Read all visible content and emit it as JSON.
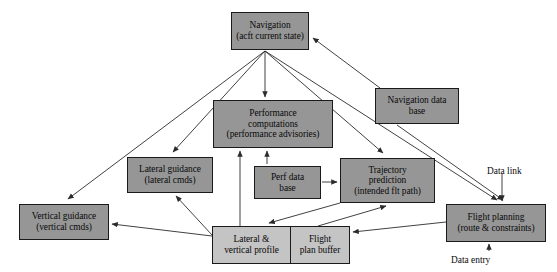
{
  "diagram": {
    "colors": {
      "node_fill": "#969696",
      "node_fill_light": "#c4c4c4",
      "node_border": "#1a1a1a",
      "edge": "#2b2b2b",
      "background": "#ffffff",
      "text": "#0a0a0a"
    },
    "nodes": [
      {
        "id": "navigation",
        "lines": [
          "Navigation",
          "(acft current state)"
        ],
        "x": 231,
        "y": 12,
        "w": 78,
        "h": 38,
        "shade": "dark"
      },
      {
        "id": "navigation-data-base",
        "lines": [
          "Navigation data",
          "base"
        ],
        "x": 375,
        "y": 88,
        "w": 84,
        "h": 36,
        "shade": "dark"
      },
      {
        "id": "performance-computations",
        "lines": [
          "Performance",
          "computations",
          "(performance advisories)"
        ],
        "x": 213,
        "y": 100,
        "w": 120,
        "h": 48,
        "shade": "dark"
      },
      {
        "id": "lateral-guidance",
        "lines": [
          "Lateral guidance",
          "(lateral cmds)"
        ],
        "x": 127,
        "y": 157,
        "w": 86,
        "h": 36,
        "shade": "dark"
      },
      {
        "id": "perf-data-base",
        "lines": [
          "Perf data",
          "base"
        ],
        "x": 254,
        "y": 166,
        "w": 67,
        "h": 33,
        "shade": "dark"
      },
      {
        "id": "trajectory-prediction",
        "lines": [
          "Trajectory",
          "prediction",
          "(intended flt path)"
        ],
        "x": 340,
        "y": 158,
        "w": 95,
        "h": 45,
        "shade": "dark"
      },
      {
        "id": "vertical-guidance",
        "lines": [
          "Vertical guidance",
          "(vertical cmds)"
        ],
        "x": 19,
        "y": 204,
        "w": 90,
        "h": 36,
        "shade": "dark"
      },
      {
        "id": "flight-planning",
        "lines": [
          "Flight planning",
          "(route & constraints)"
        ],
        "x": 446,
        "y": 204,
        "w": 100,
        "h": 38,
        "shade": "dark"
      }
    ],
    "pair_node": {
      "id": "profile-buffer",
      "x": 212,
      "y": 226,
      "w": 138,
      "h": 38,
      "shade": "light",
      "left": {
        "id": "lateral-vertical-profile",
        "lines": [
          "Lateral &",
          "vertical profile"
        ],
        "width_pct": 57
      },
      "right": {
        "id": "flight-plan-buffer",
        "lines": [
          "Flight",
          "plan buffer"
        ],
        "width_pct": 43
      }
    },
    "external_labels": [
      {
        "id": "data-link",
        "text": "Data link",
        "x": 487,
        "y": 166
      },
      {
        "id": "data-entry",
        "text": "Data entry",
        "x": 451,
        "y": 255
      }
    ],
    "edges": [
      {
        "from": "navigation",
        "to": "performance-computations",
        "path": "M 265,51 L 265,97"
      },
      {
        "from": "navigation",
        "to": "lateral-guidance",
        "path": "M 265,51 L 173,152"
      },
      {
        "from": "navigation",
        "to": "vertical-guidance",
        "path": "M 265,51 L 68,199"
      },
      {
        "from": "navigation",
        "to": "trajectory-prediction",
        "path": "M 265,51 L 383,153"
      },
      {
        "from": "navigation",
        "to": "flight-planning",
        "path": "M 265,51 L 497,200"
      },
      {
        "from": "navigation-data-base",
        "to": "navigation",
        "path": "M 380,88 L 313,38"
      },
      {
        "from": "navigation-data-base",
        "to": "flight-planning",
        "path": "M 397,125 L 503,200"
      },
      {
        "from": "perf-data-base",
        "to": "performance-computations",
        "path": "M 267,164 L 267,151"
      },
      {
        "from": "perf-data-base",
        "to": "trajectory-prediction",
        "path": "M 322,182 L 337,182"
      },
      {
        "from": "lateral-vertical-profile",
        "to": "performance-computations",
        "path": "M 240,226 L 240,151"
      },
      {
        "from": "lateral-vertical-profile",
        "to": "vertical-guidance",
        "path": "M 212,236 L 112,224"
      },
      {
        "from": "lateral-vertical-profile",
        "to": "lateral-guidance",
        "path": "M 212,235 L 176,196"
      },
      {
        "from": "trajectory-prediction",
        "to": "lateral-vertical-profile",
        "path": "M 340,203 L 269,223"
      },
      {
        "from": "flight-plan-buffer",
        "to": "trajectory-prediction",
        "path": "M 318,226 L 386,206"
      },
      {
        "from": "flight-planning",
        "to": "flight-plan-buffer",
        "path": "M 446,222 L 353,232"
      },
      {
        "from": "data-link",
        "to": "flight-planning",
        "path": "M 502,174 L 502,201"
      },
      {
        "from": "data-entry",
        "to": "flight-planning",
        "path": "M 489,251 L 489,244"
      }
    ]
  }
}
